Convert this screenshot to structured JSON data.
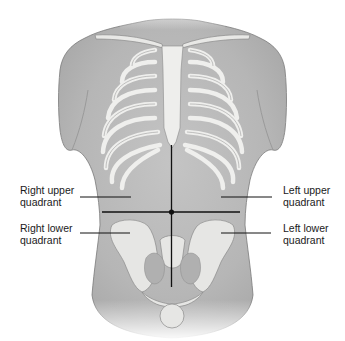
{
  "figure": {
    "labels": {
      "right_upper": {
        "line1": "Right upper",
        "line2": "quadrant"
      },
      "right_lower": {
        "line1": "Right lower",
        "line2": "quadrant"
      },
      "left_upper": {
        "line1": "Left upper",
        "line2": "quadrant"
      },
      "left_lower": {
        "line1": "Left lower",
        "line2": "quadrant"
      }
    },
    "colors": {
      "skin": "#bdbdbd",
      "skin_dark": "#9e9e9e",
      "bone": "#e6e6e4",
      "bone_outline": "#8a8a8a",
      "lines": "#111111",
      "background": "#ffffff"
    }
  }
}
